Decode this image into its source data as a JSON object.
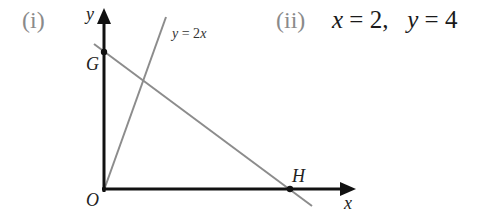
{
  "part_i": {
    "label": "(i)"
  },
  "part_ii": {
    "label": "(ii)",
    "answer": {
      "x_var": "x",
      "x_eq": " = 2,   ",
      "y_var": "y",
      "y_eq": " = 4"
    }
  },
  "diagram": {
    "axes": {
      "x_label": "x",
      "y_label": "y",
      "origin_label": "O"
    },
    "points": {
      "G": {
        "label": "G"
      },
      "H": {
        "label": "H"
      }
    },
    "lines": [
      {
        "name": "y=2x",
        "label": "y = 2x",
        "color": "#8c8c8c"
      },
      {
        "name": "GH",
        "label": "",
        "color": "#8c8c8c"
      }
    ],
    "axis_color": "#111111"
  }
}
